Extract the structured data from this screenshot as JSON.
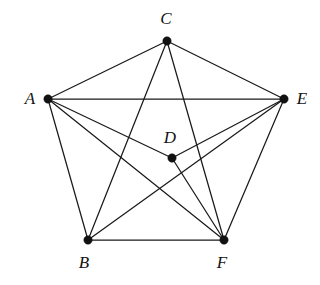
{
  "figure": {
    "background_color": "#ffffff",
    "line_color": "#1a1a1a",
    "vertex_color": "#111111",
    "label_color": "#121212",
    "width": 320,
    "height": 285
  },
  "chart_data": {
    "type": "diagram",
    "subtype": "graph-node-link",
    "title": "",
    "vertices": [
      {
        "id": "A",
        "label": "A",
        "x": 48,
        "y": 99,
        "r": 4.2,
        "label_x": 30,
        "label_y": 104
      },
      {
        "id": "B",
        "label": "B",
        "x": 88,
        "y": 240,
        "r": 4.2,
        "label_x": 84,
        "label_y": 268
      },
      {
        "id": "C",
        "label": "C",
        "x": 167,
        "y": 41,
        "r": 4.2,
        "label_x": 166,
        "label_y": 24
      },
      {
        "id": "D",
        "label": "D",
        "x": 172,
        "y": 158,
        "r": 4.2,
        "label_x": 170,
        "label_y": 143
      },
      {
        "id": "E",
        "label": "E",
        "x": 284,
        "y": 99,
        "r": 4.2,
        "label_x": 302,
        "label_y": 104
      },
      {
        "id": "F",
        "label": "F",
        "x": 224,
        "y": 240,
        "r": 4.2,
        "label_x": 222,
        "label_y": 268
      }
    ],
    "edges": [
      {
        "from": "A",
        "to": "C"
      },
      {
        "from": "A",
        "to": "E"
      },
      {
        "from": "A",
        "to": "B"
      },
      {
        "from": "A",
        "to": "D"
      },
      {
        "from": "A",
        "to": "F"
      },
      {
        "from": "C",
        "to": "E"
      },
      {
        "from": "C",
        "to": "B"
      },
      {
        "from": "C",
        "to": "F"
      },
      {
        "from": "D",
        "to": "E"
      },
      {
        "from": "D",
        "to": "F"
      },
      {
        "from": "B",
        "to": "E"
      },
      {
        "from": "B",
        "to": "F"
      },
      {
        "from": "E",
        "to": "F"
      }
    ],
    "vertex_labels": [
      "A",
      "B",
      "C",
      "D",
      "E",
      "F"
    ],
    "edge_count": 13,
    "vertex_count": 6
  }
}
